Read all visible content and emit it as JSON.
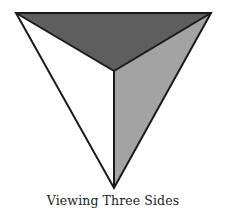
{
  "diagram": {
    "caption": "Viewing Three Sides",
    "vertices": {
      "top_left": [
        16,
        13
      ],
      "top_right": [
        211,
        13
      ],
      "bottom": [
        114,
        188
      ],
      "center": [
        114,
        71
      ]
    },
    "faces": [
      {
        "name": "top-face",
        "color": "#5e5e5e"
      },
      {
        "name": "right-face",
        "color": "#a3a3a3"
      },
      {
        "name": "left-face",
        "color": "#ffffff"
      }
    ],
    "stroke_color": "#1a1a1a"
  }
}
